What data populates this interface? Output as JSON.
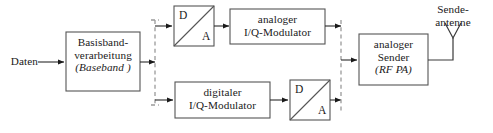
{
  "diagram": {
    "background_color": "#ffffff",
    "box_stroke_color": "#555555",
    "wire_color": "#2b2b2b",
    "dashed_wire_color": "#9a9a9a",
    "input": {
      "label": "Daten"
    },
    "blocks": {
      "baseband": {
        "line1": "Basisband-",
        "line2": "verarbeitung",
        "line3": "(Baseband )"
      },
      "dac_top": {
        "digital_letter": "D",
        "analog_letter": "A"
      },
      "dac_bottom": {
        "digital_letter": "D",
        "analog_letter": "A"
      },
      "analog_iq_modulator": {
        "line1": "analoger",
        "line2": "I/Q-Modulator"
      },
      "digital_iq_modulator": {
        "line1": "digitaler",
        "line2": "I/Q-Modulator"
      },
      "analog_transmitter": {
        "line1": "analoger",
        "line2": "Sender",
        "line3": "(RF PA)"
      }
    },
    "output": {
      "antenna_label_line1": "Sende-",
      "antenna_label_line2": "antenne",
      "antenna_icon": "antenna-icon"
    }
  }
}
